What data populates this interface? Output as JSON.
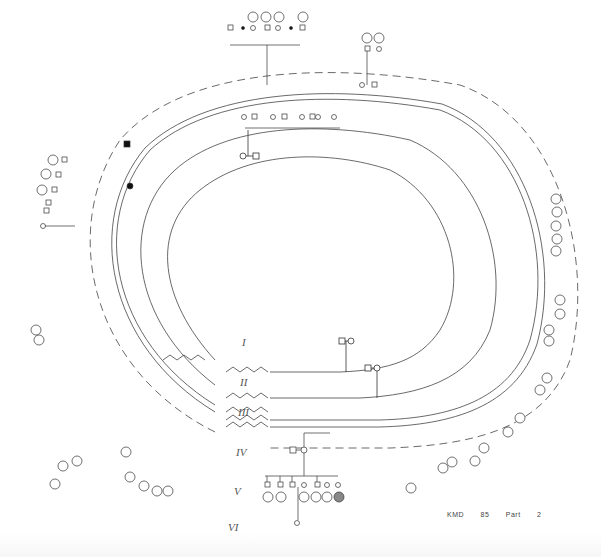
{
  "diagram": {
    "type": "pedigree",
    "layout": "concentric-oval",
    "caption": {
      "kindred": "KMD",
      "number": "85",
      "part_label": "Part",
      "part_number": "2"
    },
    "generations": [
      {
        "label": "I",
        "x": 242,
        "y": 343
      },
      {
        "label": "II",
        "x": 240,
        "y": 383
      },
      {
        "label": "III",
        "x": 238,
        "y": 412
      },
      {
        "label": "IV",
        "x": 236,
        "y": 452
      },
      {
        "label": "V",
        "x": 234,
        "y": 491
      },
      {
        "label": "VI",
        "x": 228,
        "y": 527
      }
    ],
    "founders": {
      "generation": "I",
      "members": [
        {
          "id": "1",
          "sex": "male"
        },
        {
          "id": "2",
          "sex": "female"
        }
      ]
    },
    "gen2_couple": {
      "members": [
        {
          "id": "5",
          "sex": "male"
        },
        {
          "id": "6",
          "sex": "female"
        }
      ]
    },
    "notable": {
      "affected_shaded": [
        "71",
        "230"
      ],
      "top_sibship_ids": [
        "141",
        "150",
        "110",
        "183",
        "133",
        "161",
        "185",
        "186",
        "187"
      ],
      "right_circled_ids": [
        "100",
        "111",
        "112",
        "113",
        "114"
      ],
      "bottom_circled_ids": [
        "110",
        "82",
        "111",
        "127",
        "128",
        "108",
        "109"
      ]
    },
    "colors": {
      "line": "#333333",
      "shaded": "#111111",
      "background": "#ffffff"
    }
  }
}
